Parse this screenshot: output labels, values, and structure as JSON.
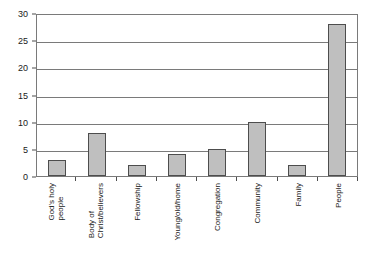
{
  "chart_data": {
    "type": "bar",
    "title": "",
    "xlabel": "",
    "ylabel": "",
    "ylim": [
      0,
      30
    ],
    "yticks": [
      0,
      5,
      10,
      15,
      20,
      25,
      30
    ],
    "grid": "horizontal",
    "legend": "none",
    "categories": [
      "God's holy\npeople",
      "Body of\nChrist/believers",
      "Fellowship",
      "Young/old/home",
      "Congregation",
      "Community",
      "Family",
      "People"
    ],
    "values": [
      3,
      8,
      2,
      4,
      5,
      10,
      2,
      28
    ],
    "bar_color": "#bfbfbf",
    "bar_border_color": "#4d4d4d",
    "axis_color": "#7a7a7a",
    "background_color": "#ffffff"
  },
  "axes": {
    "y_tick_labels": [
      "30",
      "25",
      "20",
      "15",
      "10",
      "5",
      "0"
    ]
  }
}
